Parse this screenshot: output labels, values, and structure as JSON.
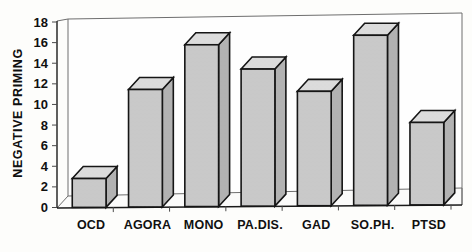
{
  "chart_data": {
    "type": "bar",
    "title": "",
    "subtitle": "",
    "xlabel": "",
    "ylabel": "NEGATIVE PRIMING",
    "categories": [
      "OCD",
      "AGORA",
      "MONO",
      "PA.DIS.",
      "GAD",
      "SO.PH.",
      "PTSD"
    ],
    "values": [
      2.8,
      11.4,
      15.7,
      13.3,
      11.1,
      16.5,
      8.0
    ],
    "ylim": [
      0,
      18
    ],
    "yticks": [
      0,
      2,
      4,
      6,
      8,
      10,
      12,
      14,
      16,
      18
    ],
    "ytick_labels": [
      "0",
      "2",
      "4",
      "6",
      "8",
      "10",
      "12",
      "14",
      "16",
      "18"
    ],
    "grid": false,
    "legend": null,
    "legend_position": "none",
    "style": "3d-bar",
    "colors": {
      "bar_front": "#c9c9c9",
      "bar_top": "#dcdcdc",
      "bar_side": "#b2b2b2",
      "bar_outline": "#151515",
      "frame": "#6e6e6e",
      "axis": "#1a1a1a",
      "text": "#101010",
      "background": "#fdfdfb"
    }
  },
  "axis": {
    "y_title": "NEGATIVE PRIMING"
  }
}
